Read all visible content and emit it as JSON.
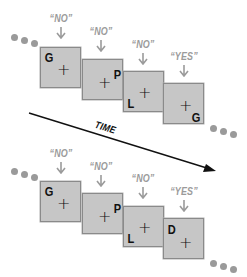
{
  "colors": {
    "box_fill": "#c6c6c6",
    "box_border": "#8a8a8a",
    "label_gray": "#9b9b9b",
    "dot_gray": "#9a9a9a",
    "ink": "#111111"
  },
  "time_axis": {
    "label": "TIME"
  },
  "sequences": [
    {
      "name": "top",
      "frames": [
        {
          "letter": "G",
          "response": "“NO”"
        },
        {
          "letter": "P",
          "response": "“NO”"
        },
        {
          "letter": "L",
          "response": "“NO”"
        },
        {
          "letter": "G",
          "response": "“YES”"
        }
      ],
      "plus_glyph": "+"
    },
    {
      "name": "bottom",
      "frames": [
        {
          "letter": "G",
          "response": "“NO”"
        },
        {
          "letter": "P",
          "response": "“NO”"
        },
        {
          "letter": "L",
          "response": "“NO”"
        },
        {
          "letter": "D",
          "response": "“YES”"
        }
      ],
      "plus_glyph": "+"
    }
  ]
}
